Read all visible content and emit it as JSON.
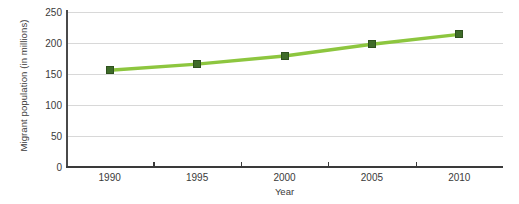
{
  "chart_data": {
    "type": "line",
    "title": "",
    "xlabel": "Year",
    "ylabel": "Migrant population (in millions)",
    "categories": [
      "1990",
      "1995",
      "2000",
      "2005",
      "2010"
    ],
    "values": [
      156,
      166,
      179,
      198,
      214
    ],
    "series": [
      {
        "name": "Migrant population",
        "values": [
          156,
          166,
          179,
          198,
          214
        ]
      }
    ],
    "ylim": [
      0,
      250
    ],
    "y_ticks": [
      "0",
      "50",
      "100",
      "150",
      "200",
      "250"
    ],
    "y_tick_values": [
      0,
      50,
      100,
      150,
      200,
      250
    ],
    "x_ticks": [
      "1990",
      "1995",
      "2000",
      "2005",
      "2010"
    ],
    "grid": "horizontal",
    "legend": "none",
    "colors": {
      "line": "#8dc63f",
      "marker": "#3e6b28",
      "marker_border": "#2f521e",
      "grid": "#d8d8d8",
      "axis": "#3a3a3a",
      "text": "#3a3a3a",
      "background": "#ffffff"
    }
  }
}
